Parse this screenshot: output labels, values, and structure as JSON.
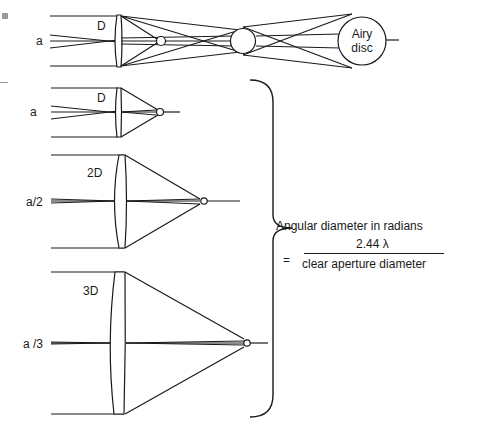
{
  "diagram": {
    "top_panel": {
      "aperture_label": "D",
      "angle_label": "a",
      "disc_label_line1": "Airy",
      "disc_label_line2": "disc"
    },
    "panels": [
      {
        "aperture_label": "D",
        "angle_label": "a"
      },
      {
        "aperture_label": "2D",
        "angle_label": "a/2"
      },
      {
        "aperture_label": "3D",
        "angle_label": "a /3"
      }
    ],
    "formula": {
      "heading": "Angular diameter in radians",
      "equals": "=",
      "numerator": "2.44 λ",
      "denominator": "clear aperture diameter"
    },
    "colors": {
      "line": "#1a1a1a",
      "background": "#ffffff",
      "marker": "#9a9a9a"
    }
  }
}
